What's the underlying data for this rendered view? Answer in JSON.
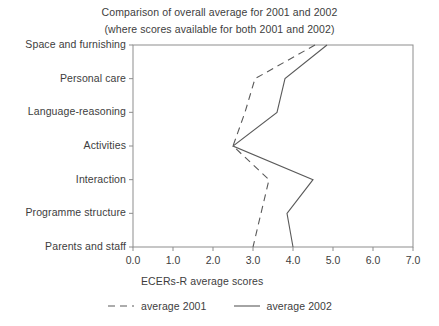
{
  "chart_data": {
    "type": "line",
    "title": "Comparison of overall average for 2001 and 2002",
    "subtitle": "(where scores available for both 2001 and 2002)",
    "orientation": "horizontal",
    "categories": [
      "Space and furnishing",
      "Personal care",
      "Language-reasoning",
      "Activities",
      "Interaction",
      "Programme structure",
      "Parents and staff"
    ],
    "series": [
      {
        "name": "average 2001",
        "style": "dashed",
        "color": "#5a5a5a",
        "values": [
          4.55,
          3.05,
          2.8,
          2.5,
          3.4,
          3.2,
          3.0
        ]
      },
      {
        "name": "average 2002",
        "style": "solid",
        "color": "#5a5a5a",
        "values": [
          4.85,
          3.8,
          3.6,
          2.5,
          4.5,
          3.85,
          4.0
        ]
      }
    ],
    "xlabel": "ECERs-R average scores",
    "ylabel": "",
    "xlim": [
      0.0,
      7.0
    ],
    "xticks": [
      "0.0",
      "1.0",
      "2.0",
      "3.0",
      "4.0",
      "5.0",
      "6.0",
      "7.0"
    ],
    "grid": false,
    "legend_position": "bottom"
  },
  "legend": {
    "items": [
      {
        "label": "average 2001",
        "style": "dashed"
      },
      {
        "label": "average 2002",
        "style": "solid"
      }
    ]
  },
  "axis": {
    "x_title": "ECERs-R average scores"
  }
}
